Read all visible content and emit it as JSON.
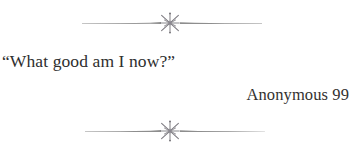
{
  "page": {
    "background_color": "#ffffff",
    "kind": "book-epigraph-page"
  },
  "epigraph": {
    "quote_text": "“What good am I now?”",
    "attribution_text": "Anonymous 99",
    "text_color": "#2e2e2e",
    "attribution_color": "#33312f"
  },
  "ornaments": {
    "glyph_name": "star-fleuron-ornament",
    "rule_color": "#8e8e8e",
    "glyph_color": "#7c7a80",
    "top": {
      "label": "top-section-divider",
      "left_rule_start_x": 82,
      "left_rule_end_x": 160,
      "right_rule_start_x": 181,
      "right_rule_end_x": 262,
      "center_x": 170,
      "center_y": 13
    },
    "bottom": {
      "label": "bottom-section-divider",
      "left_rule_start_x": 85,
      "left_rule_end_x": 160,
      "right_rule_start_x": 181,
      "right_rule_end_x": 265,
      "center_x": 170,
      "center_y": 13
    }
  }
}
